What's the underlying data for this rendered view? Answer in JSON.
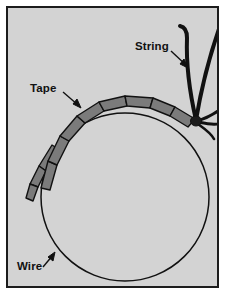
{
  "figure": {
    "title": "",
    "background_color": "#d3d3d3",
    "border_color": "#1c1c1c",
    "page_color": "#ffffff",
    "labels": {
      "string": "String",
      "tape": "Tape",
      "wire": "Wire"
    },
    "elements": {
      "wire": {
        "name": "wire-circle",
        "description": "thin black circle loop",
        "stroke_color": "#111111",
        "center_x": 117,
        "center_y": 189,
        "radius": 84
      },
      "tape": {
        "name": "tape-band",
        "description": "gray taped segments wrapped over the upper-left arc of the wire with a loose twisted tail",
        "fill_color": "#7b7b7b",
        "stroke_color": "#111111",
        "segment_count": 9
      },
      "string": {
        "name": "string-strands",
        "description": "black string tied in a knot on the wire at the upper right with two long strands rising and two loose ends splaying right",
        "stroke_color": "#111111",
        "knot_x": 188,
        "knot_y": 112
      }
    },
    "annotations": [
      {
        "name": "string-arrow",
        "from_x": 163,
        "from_y": 43,
        "to_x": 180,
        "to_y": 59
      },
      {
        "name": "tape-arrow",
        "from_x": 55,
        "from_y": 84,
        "to_x": 72,
        "to_y": 99
      },
      {
        "name": "wire-arrow",
        "from_x": 35,
        "from_y": 259,
        "to_x": 46,
        "to_y": 245
      }
    ]
  }
}
